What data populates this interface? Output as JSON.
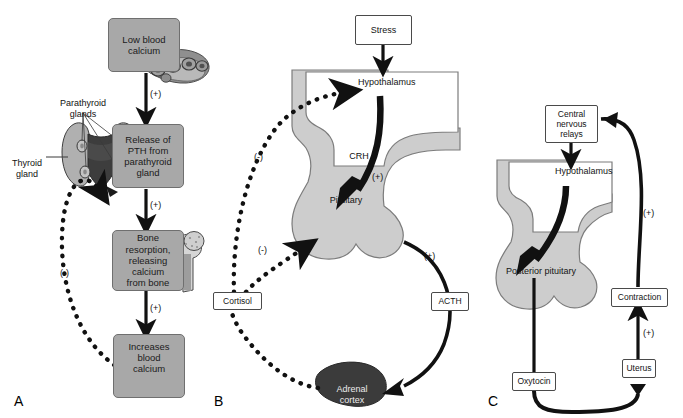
{
  "figure": {
    "type": "diagram",
    "panels": [
      {
        "letter": "A",
        "name": "parathyroid-calcium-loop"
      },
      {
        "letter": "B",
        "name": "hypothalamic-pituitary-adrenal-axis"
      },
      {
        "letter": "C",
        "name": "oxytocin-positive-feedback-loop"
      }
    ]
  },
  "panelA": {
    "letter": "A",
    "boxes": {
      "low_blood_calcium": "Low blood\ncalcium",
      "release_pth": "Release of\nPTH from\nparathyroid\ngland",
      "bone_resorption": "Bone\nresorption,\nreleasing\ncalcium\nfrom bone",
      "increases_blood_calcium": "Increases\nblood\ncalcium"
    },
    "labels": {
      "parathyroid_glands": "Parathyroid\nglands",
      "thyroid_gland": "Thyroid\ngland"
    },
    "signs": {
      "s1": "(+)",
      "s2": "(+)",
      "s3": "(+)",
      "feedback": "(-)"
    }
  },
  "panelB": {
    "letter": "B",
    "boxes": {
      "stress": "Stress",
      "cortisol": "Cortisol",
      "acth": "ACTH"
    },
    "organs": {
      "hypothalamus": "Hypothalamus",
      "pituitary": "Pituitary",
      "adrenal_cortex": "Adrenal\ncortex"
    },
    "labels": {
      "crh": "CRH"
    },
    "signs": {
      "crh_plus": "(+)",
      "acth_plus": "(+)",
      "neg_hypothalamus": "(-)",
      "neg_pituitary": "(-)"
    }
  },
  "panelC": {
    "letter": "C",
    "boxes": {
      "central_nervous_relays": "Central\nnervous\nrelays",
      "contraction": "Contraction",
      "uterus": "Uterus",
      "oxytocin": "Oxytocin"
    },
    "organs": {
      "hypothalamus": "Hypothalamus",
      "posterior_pituitary": "Posterior pituitary"
    },
    "signs": {
      "cns_plus": "(+)",
      "contraction_plus": "(+)"
    }
  },
  "colors": {
    "box_gray": "#a8a8a8",
    "box_border": "#6f6f6f",
    "organ_gray": "#cdcdcd",
    "organ_border": "#7a7a7a",
    "adrenal_dark": "#3b3b3b",
    "white": "#ffffff",
    "stroke": "#111111"
  }
}
